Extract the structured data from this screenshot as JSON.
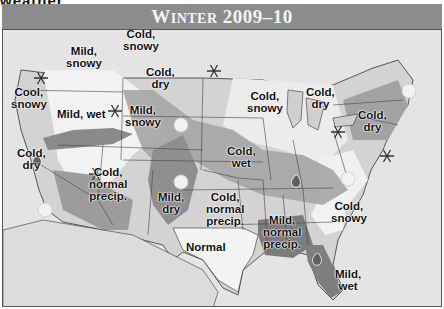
{
  "page": {
    "cutoff_heading": "weather"
  },
  "map": {
    "title": "Winter 2009–10",
    "title_parts": {
      "w": "W",
      "inter": "INTER",
      "years": " 2009–10"
    },
    "regions": [
      {
        "id": "pacific-nw",
        "label_line1": "Cool,",
        "label_line2": "snowy"
      },
      {
        "id": "idaho",
        "label_line1": "Mild,",
        "label_line2": "snowy"
      },
      {
        "id": "northern-plains",
        "label_line1": "Cold,",
        "label_line2": "snowy"
      },
      {
        "id": "central-plains",
        "label_line1": "Cold,",
        "label_line2": "dry"
      },
      {
        "id": "great-basin",
        "label_line1": "Mild, wet",
        "label_line2": ""
      },
      {
        "id": "colorado",
        "label_line1": "Mild,",
        "label_line2": "snowy"
      },
      {
        "id": "california",
        "label_line1": "Cold,",
        "label_line2": "dry"
      },
      {
        "id": "southwest",
        "label_line1": "Cold,",
        "label_line2": "normal",
        "label_line3": "precip."
      },
      {
        "id": "new-mexico",
        "label_line1": "Mild,",
        "label_line2": "dry"
      },
      {
        "id": "oklahoma",
        "label_line1": "Cold,",
        "label_line2": "normal",
        "label_line3": "precip."
      },
      {
        "id": "midwest",
        "label_line1": "Cold,",
        "label_line2": "wet"
      },
      {
        "id": "upper-midwest",
        "label_line1": "Cold,",
        "label_line2": "snowy"
      },
      {
        "id": "michigan",
        "label_line1": "Cold,",
        "label_line2": "dry"
      },
      {
        "id": "northeast",
        "label_line1": "Cold,",
        "label_line2": "dry"
      },
      {
        "id": "texas",
        "label_line1": "Normal",
        "label_line2": ""
      },
      {
        "id": "deep-south",
        "label_line1": "Mild,",
        "label_line2": "normal",
        "label_line3": "precip."
      },
      {
        "id": "southeast",
        "label_line1": "Cold,",
        "label_line2": "snowy"
      },
      {
        "id": "florida",
        "label_line1": "Mild,",
        "label_line2": "wet"
      }
    ],
    "icons": {
      "snowflakes": 7,
      "suns": 6,
      "raindrops": 3
    },
    "colors": {
      "header_bg": "#8c8c8c",
      "cold_band": "#9a9a9a",
      "light_land": "#d4d4d4",
      "white_snow_zone": "#f2f2f2",
      "dark_zone": "#7a7a7a",
      "ocean": "#e6e6e6"
    }
  }
}
